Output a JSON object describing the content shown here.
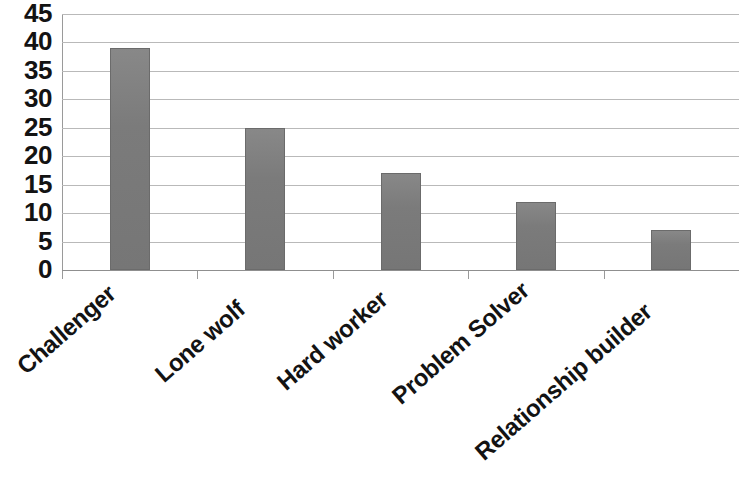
{
  "chart_data": {
    "type": "bar",
    "title": "",
    "subtitle": "",
    "xlabel": "",
    "ylabel": "",
    "categories": [
      "Challenger",
      "Lone wolf",
      "Hard worker",
      "Problem Solver",
      "Relationship builder"
    ],
    "values": [
      39,
      25,
      17,
      12,
      7
    ],
    "ylim": [
      0,
      45
    ],
    "ytick_step": 5,
    "yticks": [
      "45",
      "40",
      "35",
      "30",
      "25",
      "20",
      "15",
      "10",
      "5",
      "0"
    ],
    "grid": true,
    "grid_axis": "y",
    "legend": null,
    "legend_position": "none",
    "annotations": [],
    "bar_color": "#7c7c7c",
    "bar_edge_color": "#6b6b6b",
    "gridline_color": "#b9b9b9",
    "axis_color": "#9a9a9a",
    "background_color": "#ffffff",
    "text_color": "#131313",
    "x_label_rotation": -41
  }
}
